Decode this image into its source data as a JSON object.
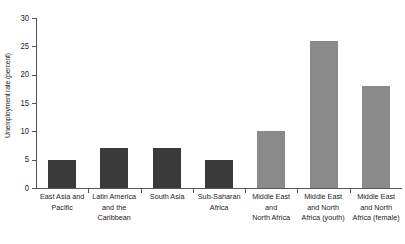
{
  "chart_data": {
    "type": "bar",
    "title": "",
    "xlabel": "",
    "ylabel": "Unemployment rate (percent)",
    "ylim": [
      0,
      30
    ],
    "yticks": [
      0,
      5,
      10,
      15,
      20,
      25,
      30
    ],
    "grid": false,
    "legend": "none",
    "categories": [
      "East Asia and Pacific",
      "Latin America and the Caribbean",
      "South Asia",
      "Sub-Saharan Africa",
      "Middle East and North Africa",
      "Middle East and North Africa (youth)",
      "Middle East and North Africa (female)"
    ],
    "category_lines": [
      [
        "East Asia and",
        "Pacific"
      ],
      [
        "Latin America",
        "and the",
        "Caribbean"
      ],
      [
        "South Asia"
      ],
      [
        "Sub-Saharan",
        "Africa"
      ],
      [
        "Middle East",
        "and",
        "North Africa"
      ],
      [
        "Middle East",
        "and North",
        "Africa (youth)"
      ],
      [
        "Middle East",
        "and North",
        "Africa (female)"
      ]
    ],
    "values": [
      5,
      7,
      7,
      5,
      10,
      26,
      18
    ],
    "bar_colors": [
      "#3a3a3a",
      "#3a3a3a",
      "#3a3a3a",
      "#3a3a3a",
      "#8a8a8a",
      "#8a8a8a",
      "#8a8a8a"
    ]
  },
  "axis": {
    "tick_labels": [
      "0",
      "5",
      "10",
      "15",
      "20",
      "25",
      "30"
    ],
    "line_color": "#555555"
  }
}
